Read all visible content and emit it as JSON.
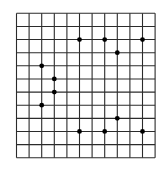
{
  "figure": {
    "type": "dot-grid",
    "colors": {
      "background": "#ffffff",
      "grid_line": "#2b2b2b",
      "dot": "#000000"
    },
    "grid": {
      "columns": 11,
      "rows": 11,
      "origin_px": [
        16.5,
        13.3
      ],
      "cell_width_px": 12.6,
      "cell_height_px": 13.13,
      "line_width_px": 1.1
    },
    "dot_radius_px": 2.4,
    "dots": [
      {
        "col": 5,
        "row": 2
      },
      {
        "col": 7,
        "row": 2
      },
      {
        "col": 10,
        "row": 2
      },
      {
        "col": 8,
        "row": 3
      },
      {
        "col": 2,
        "row": 4
      },
      {
        "col": 3,
        "row": 5
      },
      {
        "col": 3,
        "row": 6
      },
      {
        "col": 2,
        "row": 7
      },
      {
        "col": 8,
        "row": 8
      },
      {
        "col": 5,
        "row": 9
      },
      {
        "col": 7,
        "row": 9
      },
      {
        "col": 10,
        "row": 9
      }
    ]
  }
}
